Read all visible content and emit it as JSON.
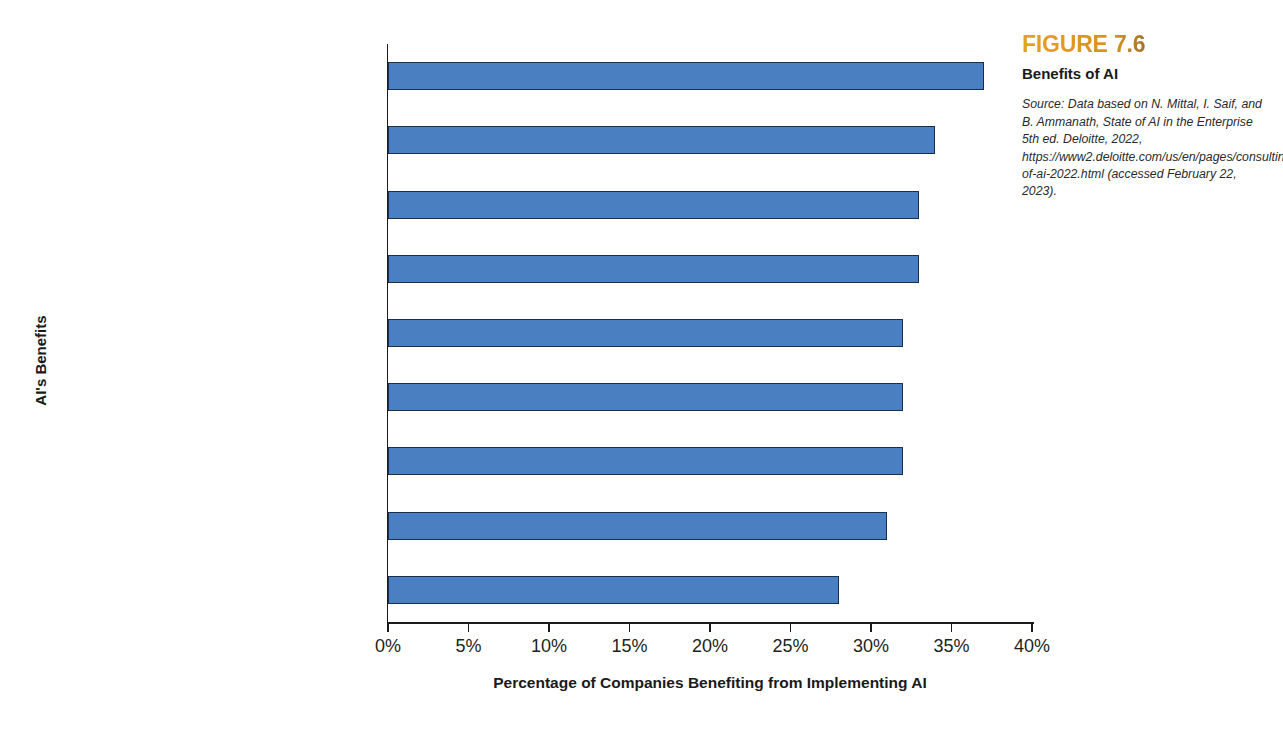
{
  "figure": {
    "number": "FIGURE 7.6",
    "title": "Benefits of AI",
    "source_label": "Source:",
    "source_text": "Source:  Data based on N. Mittal, I. Saif, and B. Ammanath, State of AI in the Enterprise 5th ed. Deloitte, 2022,  https://www2.deloitte.com/us/en/pages/consulting/articles/state-of-ai-2022.html (accessed February 22, 2023).",
    "accent_color": "#e8a020"
  },
  "chart_data": {
    "type": "bar",
    "orientation": "horizontal",
    "title": "Benefits of AI",
    "xlabel": "Percentage of Companies Benefiting from Implementing AI",
    "ylabel": "AI's Benefits",
    "xlim": [
      0,
      40
    ],
    "xtick_labels": [
      "0%",
      "5%",
      "10%",
      "15%",
      "20%",
      "25%",
      "30%",
      "35%",
      "40%"
    ],
    "xticks": [
      0,
      5,
      10,
      15,
      20,
      25,
      30,
      35,
      40
    ],
    "grid": false,
    "legend": null,
    "bar_color": "#4a7fc1",
    "bar_edge_color": "#1b2f4d",
    "categories": [
      "Lower costs",
      "Discover valuable\ninsights",
      "Make organizational\nprocesses more efficient",
      "Customize/improve existing\nproducts/services",
      "Predict demand",
      "Create new\nproducts/services",
      "Improve decision-making",
      "Increase revenue",
      "Anticipate customer needs"
    ],
    "values": [
      37,
      34,
      33,
      33,
      32,
      32,
      32,
      31,
      28
    ]
  }
}
